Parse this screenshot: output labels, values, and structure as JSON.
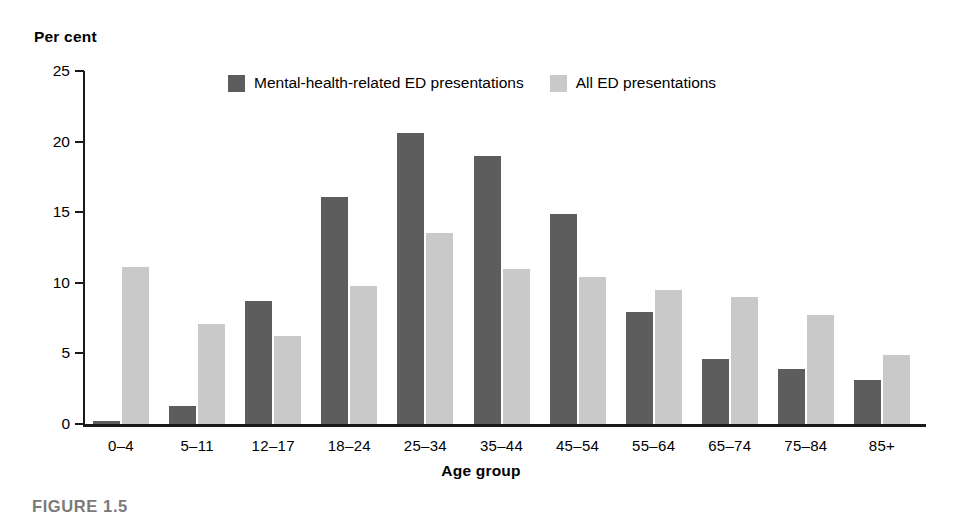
{
  "chart_data": {
    "type": "bar",
    "title": "",
    "xlabel": "Age group",
    "ylabel": "Per cent",
    "ylim": [
      0,
      25
    ],
    "yticks": [
      0,
      5,
      10,
      15,
      20,
      25
    ],
    "grid": false,
    "legend_position": "top-center",
    "categories": [
      "0–4",
      "5–11",
      "12–17",
      "18–24",
      "25–34",
      "35–44",
      "45–54",
      "55–64",
      "65–74",
      "75–84",
      "85+"
    ],
    "series": [
      {
        "name": "Mental-health-related ED presentations",
        "color": "#5d5d5d",
        "values": [
          0.2,
          1.3,
          8.7,
          16.1,
          20.6,
          19.0,
          14.9,
          7.9,
          4.6,
          3.9,
          3.1
        ]
      },
      {
        "name": "All ED presentations",
        "color": "#c9c9c9",
        "values": [
          11.1,
          7.1,
          6.2,
          9.8,
          13.5,
          11.0,
          10.4,
          9.5,
          9.0,
          7.7,
          4.9
        ]
      }
    ]
  },
  "caption": {
    "label": "FIGURE 1.5"
  }
}
